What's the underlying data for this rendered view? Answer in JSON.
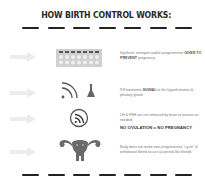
{
  "title": "HOW BIRTH CONTROL WORKS:",
  "rows": [
    {
      "icon": "pill-pack-icon",
      "text_before": "Synthetic estrogen and/or progesterone ",
      "text_emph": "GIVEN TO PREVENT",
      "text_after": " pregnancy."
    },
    {
      "icon": "signal-to-brain-icon",
      "text_before": "Pill hormones ",
      "text_emph": "SIGNAL",
      "text_after": " to the hypothalamus & pituitary gland."
    },
    {
      "icon": "blocked-signal-icon",
      "text_before": "LH & FSH are not released by brain to ovaries as needed.",
      "text_emph": "",
      "text_after": "",
      "result": "NO OVULATION = NO PREGNANCY"
    },
    {
      "icon": "uterus-icon",
      "text_before": "Body does not make own progesterone \"cycle\" & withdrawal bleed occurs (a period-like bleed).",
      "text_emph": "",
      "text_after": ""
    }
  ],
  "colors": {
    "text": "#2a2a2a",
    "muted": "#777777",
    "icon": "#6a6a6a",
    "arrow": "#e8e8e8"
  }
}
